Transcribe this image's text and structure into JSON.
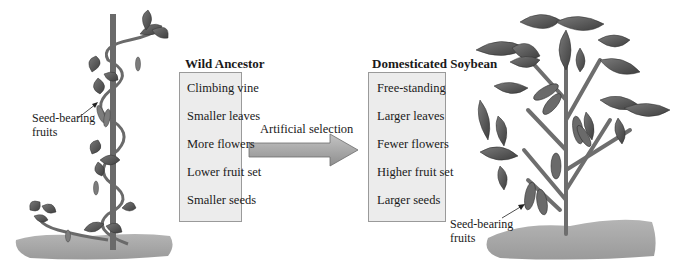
{
  "wild_ancestor": {
    "title": "Wild Ancestor",
    "traits": [
      "Climbing vine",
      "Smaller leaves",
      "More flowers",
      "Lower fruit set",
      "Smaller seeds"
    ],
    "fruit_label_line1": "Seed-bearing",
    "fruit_label_line2": "fruits"
  },
  "arrow": {
    "label": "Artificial selection"
  },
  "domesticated": {
    "title": "Domesticated Soybean",
    "traits": [
      "Free-standing",
      "Larger leaves",
      "Fewer flowers",
      "Higher fruit set",
      "Larger seeds"
    ],
    "fruit_label_line1": "Seed-bearing",
    "fruit_label_line2": "fruits"
  },
  "colors": {
    "leaf": "#5a5a5a",
    "stem": "#6e6e6e",
    "ground": "#a8a8a8",
    "box_fill": "#ececec",
    "box_border": "#9a9a9a",
    "arrow_fill": "#a6a6a6"
  }
}
